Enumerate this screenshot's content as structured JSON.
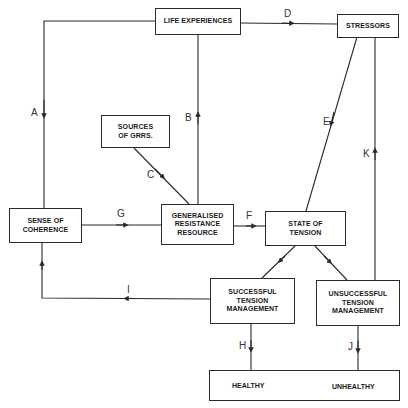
{
  "diagram": {
    "type": "flowchart",
    "nodes": {
      "life_experiences": "LIFE EXPERIENCES",
      "stressors": "STRESSORS",
      "sources_of_grrs": "SOURCES\nOF GRRS.",
      "sense_of_coherence": "SENSE OF\nCOHERENCE",
      "grr": "GENERALISED\nRESISTANCE\nRESOURCE",
      "state_of_tension": "STATE OF\nTENSION",
      "successful": "SUCCESSFUL\nTENSION\nMANAGEMENT",
      "unsuccessful": "UNSUCCESSFUL\nTENSION\nMANAGEMENT",
      "healthy": "HEALTHY",
      "unhealthy": "UNHEALTHY"
    },
    "edges": {
      "A": "A",
      "B": "B",
      "C": "C",
      "D": "D",
      "E": "E",
      "F": "F",
      "G": "G",
      "H": "H",
      "I": "I",
      "J": "J",
      "K": "K"
    },
    "edge_list": [
      {
        "label": "A",
        "from": "LIFE EXPERIENCES",
        "to": "SENSE OF COHERENCE"
      },
      {
        "label": "B",
        "from": "GENERALISED RESISTANCE RESOURCE",
        "to": "LIFE EXPERIENCES"
      },
      {
        "label": "C",
        "from": "SOURCES OF GRRS.",
        "to": "GENERALISED RESISTANCE RESOURCE"
      },
      {
        "label": "D",
        "from": "LIFE EXPERIENCES",
        "to": "STRESSORS"
      },
      {
        "label": "E",
        "from": "STRESSORS",
        "to": "STATE OF TENSION"
      },
      {
        "label": "F",
        "from": "GENERALISED RESISTANCE RESOURCE",
        "to": "STATE OF TENSION"
      },
      {
        "label": "G",
        "from": "SENSE OF COHERENCE",
        "to": "GENERALISED RESISTANCE RESOURCE"
      },
      {
        "label": "H",
        "from": "SUCCESSFUL TENSION MANAGEMENT",
        "to": "HEALTHY"
      },
      {
        "label": "I",
        "from": "SUCCESSFUL TENSION MANAGEMENT",
        "to": "SENSE OF COHERENCE"
      },
      {
        "label": "J",
        "from": "UNSUCCESSFUL TENSION MANAGEMENT",
        "to": "UNHEALTHY"
      },
      {
        "label": "K",
        "from": "UNSUCCESSFUL TENSION MANAGEMENT",
        "to": "STRESSORS"
      }
    ],
    "line_color": "#2a2a2a"
  }
}
